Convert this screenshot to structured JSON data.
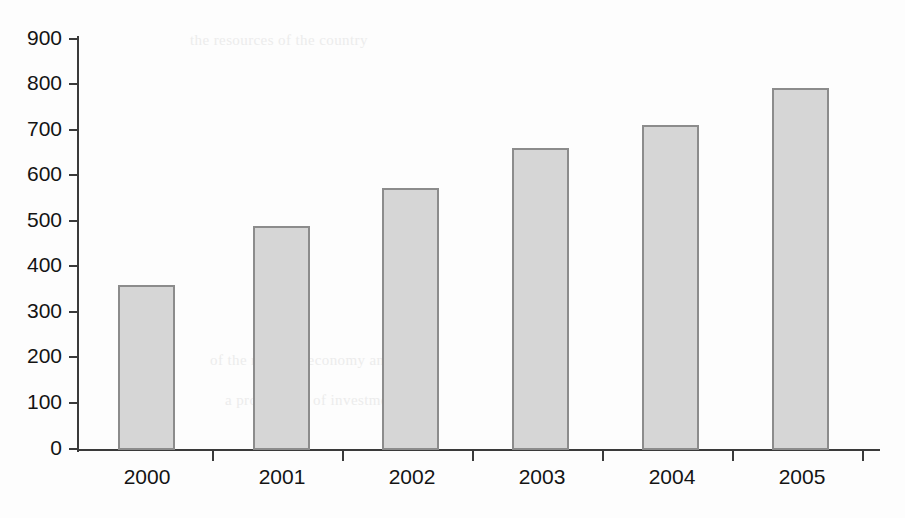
{
  "chart_data": {
    "type": "bar",
    "title": "",
    "subtitle": "",
    "xlabel": "",
    "ylabel": "",
    "categories": [
      "2000",
      "2001",
      "2002",
      "2003",
      "2004",
      "2005"
    ],
    "values": [
      360,
      490,
      572,
      660,
      710,
      790
    ],
    "series": [
      {
        "name": "",
        "values": [
          360,
          490,
          572,
          660,
          710,
          790
        ]
      }
    ],
    "ylim": [
      0,
      900
    ],
    "ytick_labels": [
      "0",
      "100",
      "200",
      "300",
      "400",
      "500",
      "600",
      "700",
      "800",
      "900"
    ],
    "ytick_values": [
      0,
      100,
      200,
      300,
      400,
      500,
      600,
      700,
      800,
      900
    ],
    "grid": false,
    "legend": false,
    "legend_position": "none",
    "annotations": [],
    "colors": {
      "bar_fill": "#d6d6d6",
      "bar_border": "#8c8c8c",
      "axis": "#3a3a3a",
      "text": "#141414",
      "background": "#fdfdfd"
    }
  },
  "artifacts": {
    "showthrough_lines": [
      "the resources of the country",
      "of the regional economy and",
      "a programme of investment"
    ]
  }
}
